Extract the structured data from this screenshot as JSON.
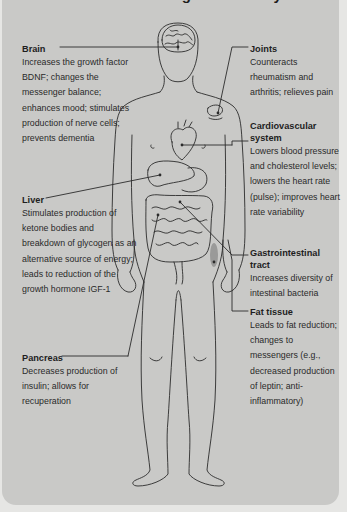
{
  "figure": {
    "title": "Effects of Fasting on the Body",
    "colors": {
      "panel_bg": "#c9c9c7",
      "page_bg": "#e6e6e4",
      "line": "#2b2b2b",
      "fat_highlight": "#8f8f8d"
    },
    "callouts": {
      "brain": {
        "label": "Brain",
        "text": "Increases the growth factor BDNF; changes the messenger balance; enhances mood; stimulates production of nerve cells; prevents dementia"
      },
      "liver": {
        "label": "Liver",
        "text": "Stimulates production of ketone bodies and breakdown of glycogen as an alternative source of energy; leads to reduction of the growth hormone IGF-1"
      },
      "pancreas": {
        "label": "Pancreas",
        "text": "Decreases production of insulin; allows for recuperation"
      },
      "joints": {
        "label": "Joints",
        "text": "Counteracts rheumatism and arthritis; relieves pain"
      },
      "cardiovascular": {
        "label": "Cardiovascular system",
        "text": "Lowers blood pressure and cholesterol levels; lowers the heart rate (pulse); improves heart rate variability"
      },
      "gastrointestinal": {
        "label": "Gastrointestinal tract",
        "text": "Increases diversity of intestinal bacteria"
      },
      "fat_tissue": {
        "label": "Fat tissue",
        "text": "Leads to fat reduction; changes to messengers (e.g., decreased production of leptin; anti-inflammatory)"
      }
    }
  }
}
